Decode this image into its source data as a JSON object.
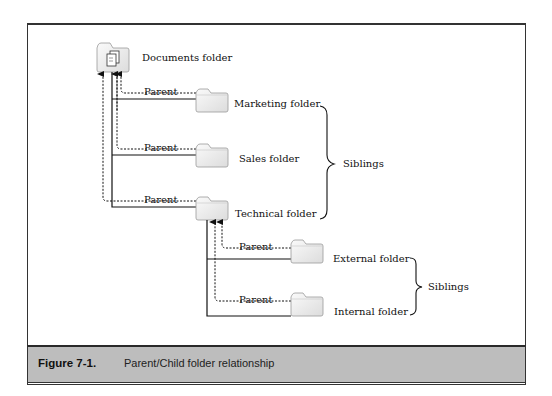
{
  "figure": {
    "number": "Figure 7-1.",
    "caption": "Parent/Child folder relationship"
  },
  "nodes": {
    "root": {
      "label": "Documents folder",
      "icon": "documents-folder-icon"
    },
    "marketing": {
      "label": "Marketing folder",
      "icon": "folder-icon"
    },
    "sales": {
      "label": "Sales folder",
      "icon": "folder-icon"
    },
    "technical": {
      "label": "Technical folder",
      "icon": "folder-icon"
    },
    "external": {
      "label": "External folder",
      "icon": "folder-icon"
    },
    "internal": {
      "label": "Internal folder",
      "icon": "folder-icon"
    }
  },
  "edges": {
    "parent_label": "Parent",
    "list": [
      {
        "from": "marketing",
        "to": "root",
        "label": "Parent"
      },
      {
        "from": "sales",
        "to": "root",
        "label": "Parent"
      },
      {
        "from": "technical",
        "to": "root",
        "label": "Parent"
      },
      {
        "from": "external",
        "to": "technical",
        "label": "Parent"
      },
      {
        "from": "internal",
        "to": "technical",
        "label": "Parent"
      }
    ]
  },
  "groups": [
    {
      "label": "Siblings",
      "members": [
        "marketing",
        "sales",
        "technical"
      ]
    },
    {
      "label": "Siblings",
      "members": [
        "external",
        "internal"
      ]
    }
  ],
  "colors": {
    "line": "#111111",
    "caption_band": "#bdbdbd",
    "folder_fill": "#f2f2f2",
    "folder_stroke": "#9a9a9a"
  }
}
